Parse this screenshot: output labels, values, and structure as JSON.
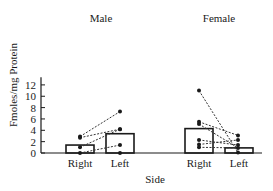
{
  "chart_data": {
    "type": "bar",
    "title": "",
    "xlabel": "Side",
    "ylabel": "Fmoles/mg Protein",
    "ylim": [
      0,
      13
    ],
    "yticks": [
      0,
      2,
      4,
      6,
      8,
      10,
      12
    ],
    "grid": false,
    "legend": null,
    "groups": [
      {
        "name": "Male",
        "categories": [
          "Right",
          "Left"
        ],
        "bar_means": [
          1.4,
          3.4
        ],
        "points": {
          "Right": [
            2.9,
            2.7,
            1.0,
            0.0
          ],
          "Left": [
            7.3,
            4.2,
            4.2,
            1.4,
            0.0
          ]
        },
        "pairs": [
          [
            2.9,
            7.3
          ],
          [
            2.7,
            4.2
          ],
          [
            1.0,
            4.2
          ],
          [
            0.0,
            1.4
          ]
        ]
      },
      {
        "name": "Female",
        "categories": [
          "Right",
          "Left"
        ],
        "bar_means": [
          4.3,
          0.9
        ],
        "points": {
          "Right": [
            11.0,
            5.5,
            5.1,
            2.3,
            1.5,
            1.0
          ],
          "Left": [
            3.1,
            2.3,
            1.4,
            0.9,
            0.1
          ]
        },
        "pairs": [
          [
            11.0,
            0.1
          ],
          [
            5.5,
            3.1
          ],
          [
            5.1,
            0.9
          ],
          [
            2.3,
            1.4
          ],
          [
            1.5,
            2.3
          ],
          [
            1.0,
            0.9
          ]
        ]
      }
    ],
    "annotations": [
      "Male",
      "Female"
    ]
  }
}
